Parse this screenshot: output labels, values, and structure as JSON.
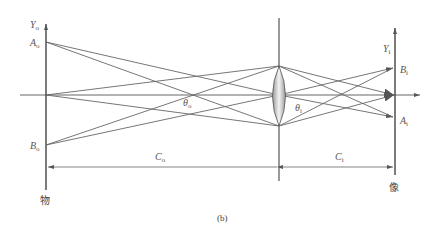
{
  "diagram": {
    "caption": "(b)",
    "object_plane": {
      "label": "物",
      "axis_label": "Y",
      "axis_sub": "o"
    },
    "image_plane": {
      "label": "像",
      "axis_label": "Y",
      "axis_sub": "i"
    },
    "points": {
      "A_o": {
        "label": "A",
        "sub": "o"
      },
      "B_o": {
        "label": "B",
        "sub": "o"
      },
      "A_i": {
        "label": "A",
        "sub": "i"
      },
      "B_i": {
        "label": "B",
        "sub": "i"
      }
    },
    "angles": {
      "theta_o": {
        "label": "θ",
        "sub": "o"
      },
      "theta_i": {
        "label": "θ",
        "sub": "i"
      }
    },
    "distances": {
      "C_o": {
        "label": "C",
        "sub": "o"
      },
      "C_i": {
        "label": "C",
        "sub": "i"
      }
    },
    "colors": {
      "line": "#555555",
      "lens_fill": "#bdbdbd",
      "text": "#555555"
    }
  }
}
